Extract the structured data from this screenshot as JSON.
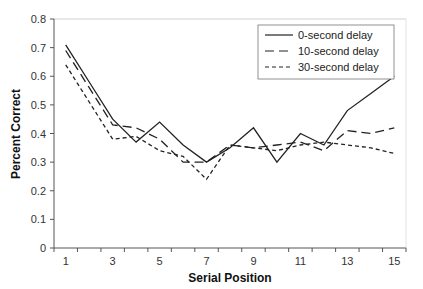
{
  "chart_data": {
    "type": "line",
    "title": "",
    "xlabel": "Serial Position",
    "ylabel": "Percent Correct",
    "x": [
      1,
      2,
      3,
      4,
      5,
      6,
      7,
      8,
      9,
      10,
      11,
      12,
      13,
      14,
      15
    ],
    "x_tick_labels": [
      "1",
      "3",
      "5",
      "7",
      "9",
      "11",
      "13",
      "15"
    ],
    "x_tick_label_positions": [
      1,
      3,
      5,
      7,
      9,
      11,
      13,
      15
    ],
    "y_tick_labels": [
      "0",
      "0.1",
      "0.2",
      "0.3",
      "0.4",
      "0.5",
      "0.6",
      "0.7",
      "0.8"
    ],
    "ylim": [
      0,
      0.8
    ],
    "grid": false,
    "legend_position": "upper right (inside)",
    "series": [
      {
        "name": "0-second delay",
        "style": "solid",
        "values": [
          0.71,
          0.58,
          0.45,
          0.37,
          0.44,
          0.36,
          0.3,
          0.35,
          0.42,
          0.3,
          0.4,
          0.36,
          0.48,
          0.54,
          0.6
        ]
      },
      {
        "name": "10-second delay",
        "style": "long-dash",
        "values": [
          0.69,
          0.56,
          0.43,
          0.42,
          0.38,
          0.3,
          0.3,
          0.36,
          0.35,
          0.36,
          0.37,
          0.34,
          0.41,
          0.4,
          0.42
        ]
      },
      {
        "name": "30-second delay",
        "style": "short-dash",
        "values": [
          0.64,
          0.51,
          0.38,
          0.39,
          0.34,
          0.32,
          0.24,
          0.36,
          0.35,
          0.34,
          0.36,
          0.37,
          0.36,
          0.35,
          0.33
        ]
      }
    ]
  },
  "colors": {
    "line": "#222222",
    "axis": "#555555",
    "frame": "#cccccc"
  }
}
